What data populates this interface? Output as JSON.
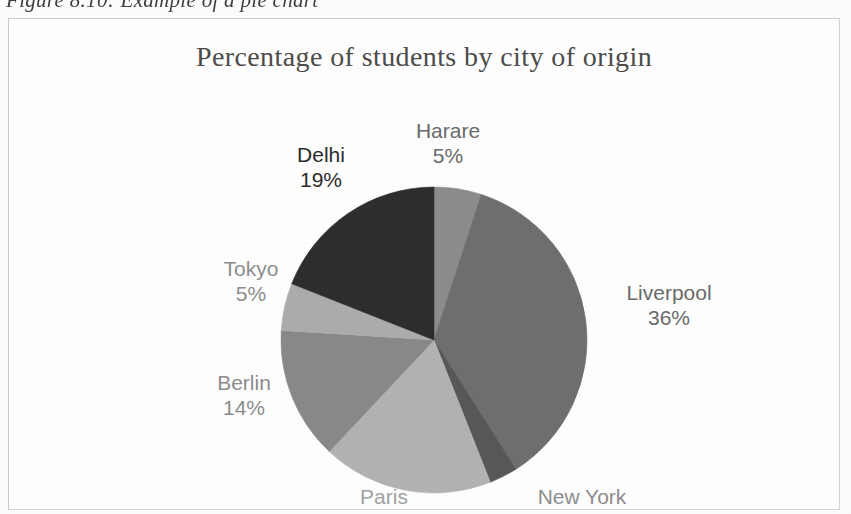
{
  "caption": {
    "text": "Figure 8.10: Example of a pie chart"
  },
  "chart": {
    "title": "Percentage of students by city of origin"
  },
  "chart_data": {
    "type": "pie",
    "title": "Percentage of students by city of origin",
    "xlabel": "",
    "ylabel": "",
    "legend": "none",
    "labels_shown": "category name and percentage at slice edge",
    "start_angle_deg": 0,
    "direction": "clockwise",
    "categories": [
      "Harare",
      "Liverpool",
      "New York",
      "Paris",
      "Berlin",
      "Tokyo",
      "Delhi"
    ],
    "values": [
      5,
      36,
      3,
      18,
      14,
      5,
      19
    ],
    "unit": "%",
    "total": 100,
    "slices": [
      {
        "label": "Harare",
        "value": 5,
        "display": "5%",
        "color": "#8d8d8d",
        "label_color": "#6b6b6b"
      },
      {
        "label": "Liverpool",
        "value": 36,
        "display": "36%",
        "color": "#6f6f6f",
        "label_color": "#6b6b6b"
      },
      {
        "label": "New York",
        "value": 3,
        "display": "3%",
        "color": "#585858",
        "label_color": "#8e8e8e"
      },
      {
        "label": "Paris",
        "value": 18,
        "display": "18%",
        "color": "#b3b3b3",
        "label_color": "#a2a2a2"
      },
      {
        "label": "Berlin",
        "value": 14,
        "display": "14%",
        "color": "#8a8a8a",
        "label_color": "#8e8e8e"
      },
      {
        "label": "Tokyo",
        "value": 5,
        "display": "5%",
        "color": "#adadad",
        "label_color": "#8e8e8e"
      },
      {
        "label": "Delhi",
        "value": 19,
        "display": "19%",
        "color": "#2e2e2e",
        "label_color": "#2c2c2c"
      }
    ]
  },
  "labels": {
    "harare": {
      "name": "Harare",
      "pct": "5%"
    },
    "delhi": {
      "name": "Delhi",
      "pct": "19%"
    },
    "tokyo": {
      "name": "Tokyo",
      "pct": "5%"
    },
    "berlin": {
      "name": "Berlin",
      "pct": "14%"
    },
    "paris": {
      "name": "Paris",
      "pct": "18%"
    },
    "newyork": {
      "name": "New York",
      "pct": "3%"
    },
    "liverpool": {
      "name": "Liverpool",
      "pct": "36%"
    }
  }
}
